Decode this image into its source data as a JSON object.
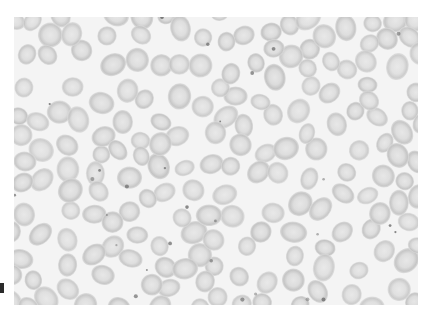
{
  "image": {
    "subject": "Peripheral blood smear micrograph showing red blood cells",
    "caption": "",
    "background_color": "#f4f4f4",
    "cell_fill_color": "#dcdcdc",
    "cell_edge_color": "#c4c4c4",
    "cell_center_color": "#e6e6e6",
    "inclusion_color": "#6a6a6a",
    "page_color": "#ffffff"
  }
}
